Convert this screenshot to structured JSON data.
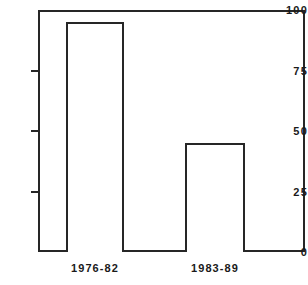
{
  "chart_data": {
    "type": "bar",
    "title": "",
    "subtitle": "",
    "xlabel": "",
    "ylabel": "",
    "categories": [
      "1976-82",
      "1983-89"
    ],
    "values": [
      95,
      45
    ],
    "series": [
      {
        "name": "",
        "values": [
          95,
          45
        ]
      }
    ],
    "ylim": [
      0,
      100
    ],
    "yticks": [
      0,
      25,
      50,
      75,
      100
    ],
    "ytick_labels": [
      "0",
      "25",
      "50",
      "75",
      "100"
    ],
    "grid": false,
    "legend": false,
    "legend_position": "none",
    "bar_fill_color": "#ffffff",
    "bar_edge_color": "#262626",
    "axis_color": "#262626",
    "background_color": "#ffffff",
    "frame": "box",
    "annotations": []
  },
  "axis": {
    "y_tick_0": "0",
    "y_tick_25": "25",
    "y_tick_50": "50",
    "y_tick_75": "75",
    "y_tick_100": "100"
  },
  "categories": {
    "cat_0": "1976-82",
    "cat_1": "1983-89"
  }
}
